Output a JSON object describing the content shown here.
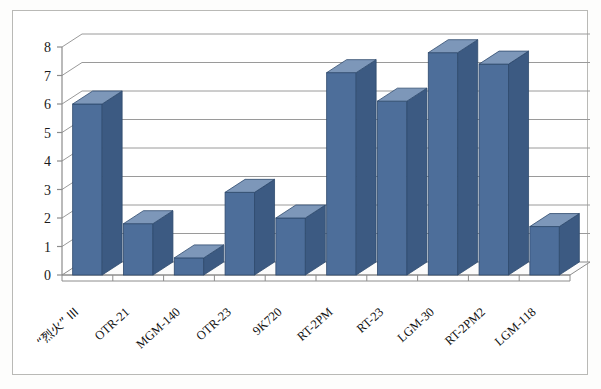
{
  "figure": {
    "background_color": "#fdfdfc",
    "plot_background_color": "#ffffff",
    "border_color": "#b9b9b6"
  },
  "style": {
    "bar_front_color": "#4d6e9a",
    "bar_side_color": "#3c5a82",
    "bar_top_color": "#7d97b9",
    "bar_edge_color": "#2f4a6d",
    "gridline_color": "#9a9a9a",
    "axis_color": "#8c8c8c",
    "floor_color": "#fbfbfb"
  },
  "chart_data": {
    "type": "bar",
    "title": "",
    "subtitle": "",
    "xlabel": "",
    "ylabel": "",
    "ylim": [
      0,
      8
    ],
    "ytick_labels": [
      "0",
      "1",
      "2",
      "3",
      "4",
      "5",
      "6",
      "7",
      "8"
    ],
    "yticks": [
      0,
      1,
      2,
      3,
      4,
      5,
      6,
      7,
      8
    ],
    "grid": true,
    "legend": false,
    "legend_position": "none",
    "three_d": true,
    "categories": [
      "“烈火” III",
      "OTR-21",
      "MGM-140",
      "OTR-23",
      "9K720",
      "RT-2PM",
      "RT-23",
      "LGM-30",
      "RT-2PM2",
      "LGM-118"
    ],
    "values": [
      6.0,
      1.8,
      0.6,
      2.9,
      2.0,
      7.1,
      6.1,
      7.8,
      7.4,
      1.7
    ]
  }
}
